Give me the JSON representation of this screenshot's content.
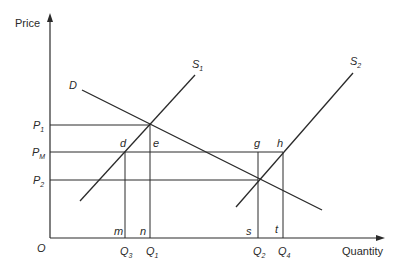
{
  "axes": {
    "y_label": "Price",
    "x_label": "Quantity",
    "origin": "O"
  },
  "curves": {
    "demand": "D",
    "supply1": {
      "base": "S",
      "sub": "1"
    },
    "supply2": {
      "base": "S",
      "sub": "2"
    }
  },
  "price_levels": {
    "p1": {
      "base": "P",
      "sub": "1"
    },
    "pm": {
      "base": "P",
      "sub": "M"
    },
    "p2": {
      "base": "P",
      "sub": "2"
    }
  },
  "quantity_levels": {
    "q3": {
      "base": "Q",
      "sub": "3"
    },
    "q1": {
      "base": "Q",
      "sub": "1"
    },
    "q2": {
      "base": "Q",
      "sub": "2"
    },
    "q4": {
      "base": "Q",
      "sub": "4"
    }
  },
  "point_labels": {
    "d": "d",
    "e": "e",
    "g": "g",
    "h": "h",
    "m": "m",
    "n": "n",
    "s": "s",
    "t": "t"
  },
  "colors": {
    "line": "#2a2a2a",
    "background": "#ffffff"
  }
}
